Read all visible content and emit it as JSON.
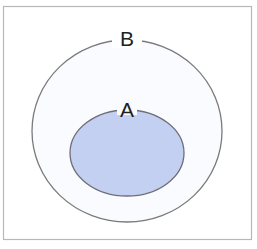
{
  "diagram": {
    "type": "venn-subset",
    "outer_set": {
      "label": "B",
      "fill": "#f9fbfe",
      "stroke": "#7a7a7a"
    },
    "inner_set": {
      "label": "A",
      "fill": "#c3d0f2",
      "stroke": "#6e6e78"
    },
    "frame": {
      "stroke": "#b8b8b8",
      "background": "#ffffff"
    }
  }
}
